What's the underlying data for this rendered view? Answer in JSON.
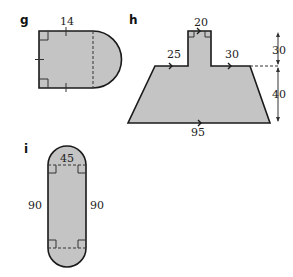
{
  "figures": [
    {
      "id": "g",
      "label": "g",
      "shape": "rectangle with semicircle on right side",
      "measurements": [
        "14"
      ],
      "marks": [
        "right-angle marks at left corners",
        "tick marks indicating equal sides",
        "dashed diameter line"
      ]
    },
    {
      "id": "h",
      "label": "h",
      "shape": "trapezoid with rectangle on top",
      "measurements": [
        "20",
        "25",
        "30",
        "95",
        "30",
        "40"
      ],
      "dimension_labels": {
        "top_width": "20",
        "left_top": "25",
        "right_top": "30",
        "bottom": "95",
        "stem_height": "30",
        "trapezoid_height": "40"
      },
      "marks": [
        "parallel arrows",
        "right-angle marks",
        "dashed extension line",
        "vertical dimension arrows"
      ]
    },
    {
      "id": "i",
      "label": "i",
      "shape": "rectangle with semicircles at top and bottom (stadium)",
      "measurements": [
        "45",
        "90",
        "90"
      ],
      "dimension_labels": {
        "width": "45",
        "left_height": "90",
        "right_height": "90"
      },
      "marks": [
        "right-angle marks at four corners",
        "dashed diameter lines"
      ]
    }
  ],
  "colors": {
    "fill": "#c4c4c4",
    "stroke": "#1a1a1a"
  }
}
